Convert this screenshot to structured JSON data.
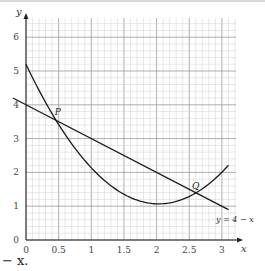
{
  "chart_data": {
    "type": "line",
    "title": "",
    "xlabel": "x",
    "ylabel": "y",
    "xlim": [
      0,
      3.2
    ],
    "ylim": [
      0,
      6.5
    ],
    "grid": true,
    "x_ticks": [
      "0",
      "0.5",
      "1",
      "1.5",
      "2",
      "2.5",
      "3"
    ],
    "y_ticks": [
      "0",
      "1",
      "2",
      "3",
      "4",
      "5",
      "6"
    ],
    "series": [
      {
        "name": "y = 4 − x",
        "kind": "line",
        "label": "y = 4 − x",
        "x": [
          -0.2,
          3.1
        ],
        "y": [
          4.2,
          0.9
        ]
      },
      {
        "name": "y = x² − 4x + 5",
        "kind": "curve",
        "x": [
          0.0,
          0.25,
          0.5,
          0.75,
          1.0,
          1.25,
          1.5,
          1.75,
          2.0,
          2.25,
          2.5,
          2.75,
          3.0,
          3.1
        ],
        "y": [
          5.2,
          4.06,
          3.25,
          2.56,
          2.0,
          1.56,
          1.25,
          1.06,
          1.0,
          1.06,
          1.25,
          1.56,
          2.0,
          2.4
        ]
      }
    ],
    "annotations": [
      {
        "label": "P",
        "x": 0.38,
        "y": 3.62
      },
      {
        "label": "Q",
        "x": 2.62,
        "y": 1.38
      }
    ]
  },
  "labels": {
    "x_axis": "x",
    "y_axis": "y",
    "line_equation": "y = 4 − x",
    "point_p": "P",
    "point_q": "Q"
  },
  "footer": {
    "text": "− x."
  }
}
